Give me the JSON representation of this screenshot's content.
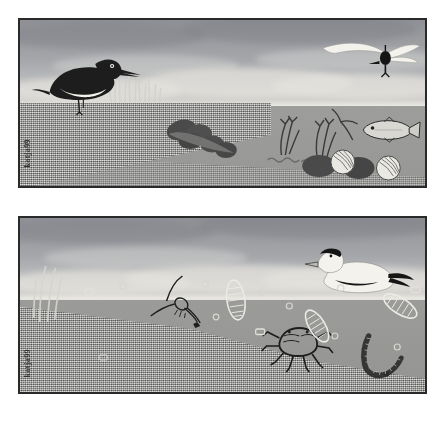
{
  "artwork": {
    "title": "Intertidal habitat illustration pair",
    "panel_count": 2,
    "signature_top": "katja99",
    "signature_bottom": "katja99",
    "background_color": "#ffffff",
    "frame_color": "#2a2a2a"
  },
  "panels": [
    {
      "id": "panel-top",
      "name": "Exposed mudflat at low tide",
      "signature": "katja99",
      "sky": {
        "label": "Overcast grey sky with cloud bands",
        "top_color": "#8e9095",
        "horizon_color": "#d6d4d0"
      },
      "ground": {
        "label": "Sandflat and shallow water",
        "sand_color": "#9d9d9b",
        "water_color": "#9a9a98"
      },
      "organisms": [
        {
          "name": "oystercatcher",
          "label": "Oystercatcher wading bird",
          "color": "#1d1d1d",
          "accent": "#f2f0ea"
        },
        {
          "name": "gull-in-flight",
          "label": "Gull flying with spread wings",
          "color": "#f2f0ea",
          "accent": "#151515"
        },
        {
          "name": "saltmarsh-grass",
          "label": "Saltmarsh grass clump",
          "color": "#cfcdc8"
        },
        {
          "name": "boulder-cluster",
          "label": "Dark boulder cluster",
          "color": "#4e4e4e"
        },
        {
          "name": "seaweed-wrack-left",
          "label": "Seaweed frond",
          "color": "#3a3a3a"
        },
        {
          "name": "seaweed-wrack-right",
          "label": "Seaweed frond",
          "color": "#3a3a3a"
        },
        {
          "name": "drifting-weed",
          "label": "Drifting weed fragment",
          "color": "#3a3a3a"
        },
        {
          "name": "fish",
          "label": "Silver fish swimming",
          "color": "#d9d7d2",
          "accent": "#1d1d1d"
        },
        {
          "name": "periwinkle-shells",
          "label": "Striped periwinkle shells",
          "color": "#e6e4de"
        },
        {
          "name": "mussel-bed-strand",
          "label": "Mussel strand on sand",
          "color": "#6a6a6a"
        }
      ]
    },
    {
      "id": "panel-bottom",
      "name": "Submerged sandflat at high tide",
      "signature": "katja99",
      "sky": {
        "label": "Grey sky above waterline",
        "top_color": "#8e9095",
        "horizon_color": "#d6d4d0"
      },
      "ground": {
        "label": "Submerged sand with suspended shells",
        "sand_color": "#9d9d9b",
        "water_color": "#9b9b99"
      },
      "organisms": [
        {
          "name": "eider-duck",
          "label": "Eider duck floating on surface",
          "color": "#f2f0ea",
          "accent": "#151515"
        },
        {
          "name": "reed-stems",
          "label": "Reed stems at left edge",
          "color": "#d5d3ce"
        },
        {
          "name": "shrimp",
          "label": "Shrimp with long antennae",
          "color": "#1d1d1d"
        },
        {
          "name": "shore-crab",
          "label": "Shore crab on sand",
          "color": "#1d1d1d"
        },
        {
          "name": "lugworm",
          "label": "Segmented lugworm burrowing",
          "color": "#2a2a2a"
        },
        {
          "name": "razor-shell-1",
          "label": "Ribbed razor shell",
          "color": "#eceae4"
        },
        {
          "name": "razor-shell-2",
          "label": "Ribbed razor shell",
          "color": "#eceae4"
        },
        {
          "name": "razor-shell-3",
          "label": "Ribbed razor shell",
          "color": "#eceae4"
        },
        {
          "name": "bivalve-shells",
          "label": "Small bivalve shells suspended",
          "color": "#e2e0da"
        },
        {
          "name": "bubbles",
          "label": "Bubbles in water column",
          "color": "#d8d6d0"
        }
      ]
    }
  ]
}
